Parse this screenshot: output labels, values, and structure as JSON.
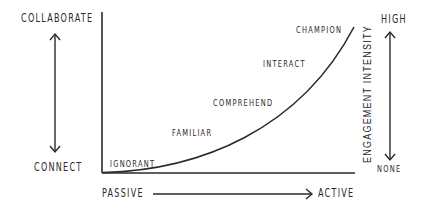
{
  "diagram": {
    "left_scale": {
      "top_label": "COLLABORATE",
      "bottom_label": "CONNECT"
    },
    "right_scale": {
      "top_label": "HIGH",
      "bottom_label": "NONE",
      "axis_title": "ENGAGEMENT INTENSITY"
    },
    "bottom_scale": {
      "left_label": "PASSIVE",
      "right_label": "ACTIVE"
    },
    "curve_stages": [
      {
        "label": "IGNORANT"
      },
      {
        "label": "FAMILIAR"
      },
      {
        "label": "COMPREHEND"
      },
      {
        "label": "INTERACT"
      },
      {
        "label": "CHAMPION"
      }
    ],
    "colors": {
      "line": "#2a2a2a",
      "text": "#2a2a2a",
      "background": "#ffffff"
    }
  }
}
